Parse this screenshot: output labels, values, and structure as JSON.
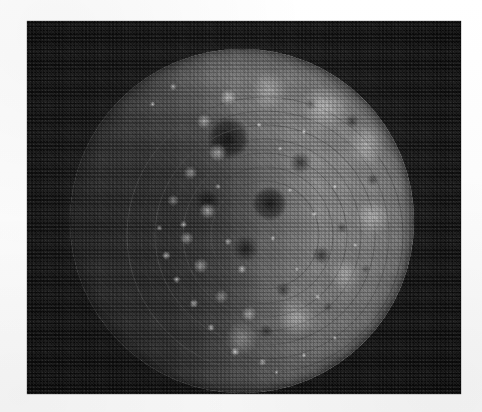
{
  "page": {
    "background_color": "#fdfdfd",
    "width": 482,
    "height": 412,
    "caption": ""
  },
  "photo": {
    "subject": "petri-dish-colony-plate",
    "description": "Grayscale halftone photograph of a circular culture dish covered with scattered bacterial colonies",
    "frame": {
      "left": 27,
      "top": 21,
      "width": 434,
      "height": 373,
      "background_color": "#0a0a0a",
      "vignette_color": "#1f1f1f"
    },
    "dish": {
      "left": 43,
      "top": 28,
      "diameter": 344,
      "center_x": 215,
      "center_y": 200,
      "radius": 172,
      "agar_color": "#7e7e7e",
      "shadow_color": "#2a2a2a",
      "colony_color": "#c8c8c8",
      "void_color": "#303030",
      "rim_color": "#4a4a4a"
    },
    "arcs": {
      "count": 4,
      "stroke_color": "#4e4e4e",
      "stroke_width": 0.9,
      "radii": [
        54,
        82,
        110,
        138
      ],
      "origin_x": 238,
      "origin_y": 214
    },
    "tone": {
      "darkest": "#070707",
      "mid": "#6d6d6d",
      "brightest": "#d2d2d2"
    },
    "halftone": {
      "enabled": true,
      "screen_angle_deg": 45,
      "opacity": 0.3
    }
  }
}
